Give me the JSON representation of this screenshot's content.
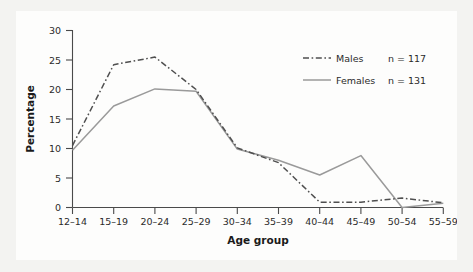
{
  "chart_data": {
    "type": "line",
    "title": "",
    "xlabel": "Age group",
    "ylabel": "Percentage",
    "categories": [
      "12–14",
      "15–19",
      "20–24",
      "25–29",
      "30–34",
      "35–39",
      "40–44",
      "45–49",
      "50–54",
      "55–59"
    ],
    "yticks": [
      "0",
      "5",
      "10",
      "15",
      "20",
      "25",
      "30"
    ],
    "ylim": [
      0,
      30
    ],
    "grid": false,
    "legend_position": "top-right",
    "series": [
      {
        "name": "Males",
        "count_label": "n = 117",
        "n": 117,
        "style": "dash-dot",
        "color": "#4f4f4f",
        "values": [
          10.5,
          24.2,
          25.5,
          20.0,
          10.1,
          7.6,
          0.9,
          0.9,
          1.6,
          0.8
        ]
      },
      {
        "name": "Females",
        "count_label": "n = 131",
        "n": 131,
        "style": "solid",
        "color": "#9a9a9a",
        "values": [
          9.7,
          17.2,
          20.1,
          19.7,
          9.9,
          8.0,
          5.5,
          8.8,
          0.0,
          0.7
        ]
      }
    ]
  },
  "legend": {
    "items": [
      {
        "label": "Males",
        "count": "n = 117"
      },
      {
        "label": "Females",
        "count": "n = 131"
      }
    ]
  },
  "axes": {
    "y_title": "Percentage",
    "x_title": "Age group"
  }
}
